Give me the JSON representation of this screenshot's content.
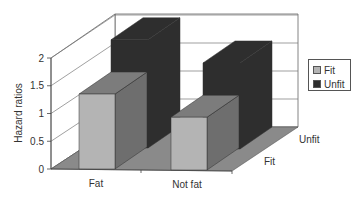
{
  "chart_data": {
    "type": "bar",
    "subtype": "3d-clustered-bar",
    "title": "",
    "xlabel": "",
    "ylabel": "Hazard ratios",
    "ylim": [
      0,
      2
    ],
    "yticks": [
      "0",
      "0.5",
      "1",
      "1.5",
      "2"
    ],
    "categories": [
      "Fat",
      "Not fat"
    ],
    "depth_labels": [
      "Fit",
      "Unfit"
    ],
    "series": [
      {
        "name": "Fit",
        "color": "#b4b4b4",
        "values": [
          1.35,
          0.95
        ]
      },
      {
        "name": "Unfit",
        "color": "#2e2e2e",
        "values": [
          1.95,
          1.55
        ]
      }
    ],
    "grid": true,
    "legend_position": "right"
  },
  "axis": {
    "ylabel": "Hazard ratios",
    "yticks": [
      "0",
      "0.5",
      "1",
      "1.5",
      "2"
    ],
    "categories": [
      "Fat",
      "Not fat"
    ],
    "depth_labels": [
      "Fit",
      "Unfit"
    ]
  },
  "legend": {
    "items": [
      {
        "label": "Fit",
        "color": "#b4b4b4"
      },
      {
        "label": "Unfit",
        "color": "#2e2e2e"
      }
    ]
  }
}
